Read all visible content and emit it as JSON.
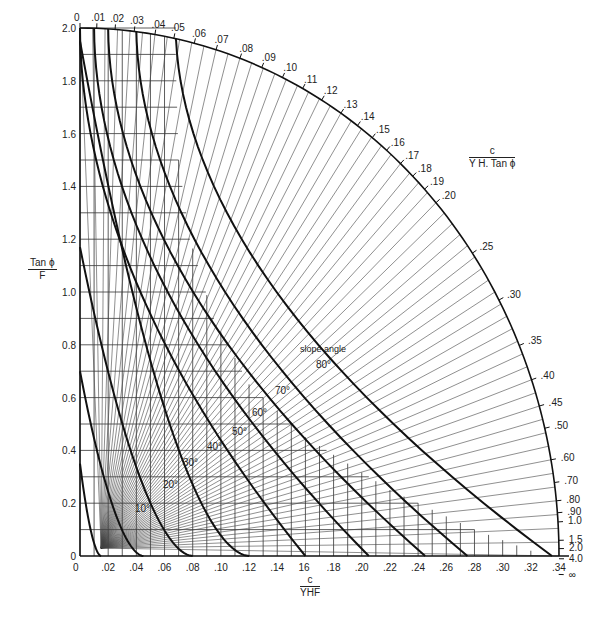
{
  "chart_data": {
    "type": "line",
    "title": "",
    "xlabel": {
      "numerator": "c",
      "denominator": "YHF"
    },
    "ylabel": {
      "numerator": "Tan ϕ",
      "denominator": "F"
    },
    "arc_label": {
      "numerator": "c",
      "denominator": "Y H. Tan ϕ"
    },
    "curve_family_label": "slope angle",
    "xlim": [
      0,
      0.34
    ],
    "ylim": [
      0,
      2.0
    ],
    "x_ticks": [
      "0",
      ".02",
      ".04",
      ".06",
      ".08",
      ".10",
      ".12",
      ".14",
      "16",
      ".18",
      ".20",
      ".22",
      ".24",
      ".26",
      ".28",
      ".30",
      ".32",
      ".34"
    ],
    "y_ticks": [
      "0",
      "0.2",
      "0.4",
      "0.6",
      "0.8",
      "1.0",
      "1.2",
      "1.4",
      "1.6",
      "1.8",
      "2.0"
    ],
    "arc_scale_ticks": [
      "0",
      ".01",
      ".02",
      ".03",
      ".04",
      ".05",
      ".06",
      ".07",
      ".08",
      ".09",
      ".10",
      ".11",
      ".12",
      ".13",
      ".14",
      ".15",
      ".16",
      ".17",
      ".18",
      ".19",
      ".20",
      ".25",
      ".30",
      ".35",
      ".40",
      ".45",
      ".50",
      ".60",
      ".70",
      ".80",
      ".90",
      "1.0",
      "1.5",
      "2.0",
      "4.0",
      "∞"
    ],
    "slope_angle_curves": [
      {
        "label": "10°",
        "x_intercept": 0.015,
        "y_intercept": 0.35
      },
      {
        "label": "20°",
        "x_intercept": 0.045,
        "y_intercept": 0.7
      },
      {
        "label": "30°",
        "x_intercept": 0.08,
        "y_intercept": 1.17
      },
      {
        "label": "40°",
        "x_intercept": 0.12,
        "y_intercept": 1.95
      },
      {
        "label": "50°",
        "x_intercept": 0.16,
        "top_arc_value": "0"
      },
      {
        "label": "60°",
        "x_intercept": 0.205,
        "top_arc_value": ".01"
      },
      {
        "label": "70°",
        "x_intercept": 0.245,
        "top_arc_value": ".02"
      },
      {
        "label": "80°",
        "x_intercept": 0.275,
        "top_arc_value": ".04"
      },
      {
        "label": "90°",
        "x_intercept": 0.335,
        "top_arc_value": ".07"
      }
    ],
    "grid": true,
    "legend": null
  }
}
